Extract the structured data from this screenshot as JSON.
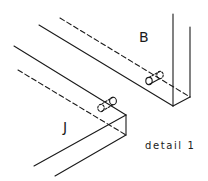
{
  "diagram": {
    "type": "assembly detail drawing (isometric dowel joint)",
    "parts": [
      {
        "id": "B",
        "label": "B"
      },
      {
        "id": "J",
        "label": "J"
      }
    ],
    "caption": "detail 1",
    "colors": {
      "ink": "#1a1a1a",
      "background": "#ffffff"
    }
  }
}
